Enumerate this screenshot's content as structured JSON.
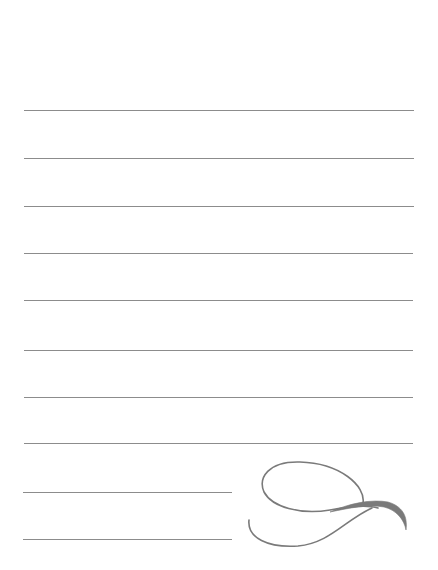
{
  "page": {
    "type": "lined-notepaper",
    "background_color": "#ffffff",
    "rule_color": "#8c8c8c",
    "flourish_color": "#7a7a7a",
    "full_rules": [
      {
        "y": 110,
        "x1": 24,
        "x2": 414
      },
      {
        "y": 158,
        "x1": 24,
        "x2": 414
      },
      {
        "y": 206,
        "x1": 24,
        "x2": 414
      },
      {
        "y": 253,
        "x1": 24,
        "x2": 413
      },
      {
        "y": 300,
        "x1": 24,
        "x2": 413
      },
      {
        "y": 350,
        "x1": 24,
        "x2": 413
      },
      {
        "y": 397,
        "x1": 24,
        "x2": 413
      },
      {
        "y": 443,
        "x1": 24,
        "x2": 413
      }
    ],
    "short_rules": [
      {
        "y": 492,
        "x1": 23,
        "x2": 232
      },
      {
        "y": 539,
        "x1": 23,
        "x2": 232
      }
    ],
    "decoration": "flourish-icon"
  }
}
